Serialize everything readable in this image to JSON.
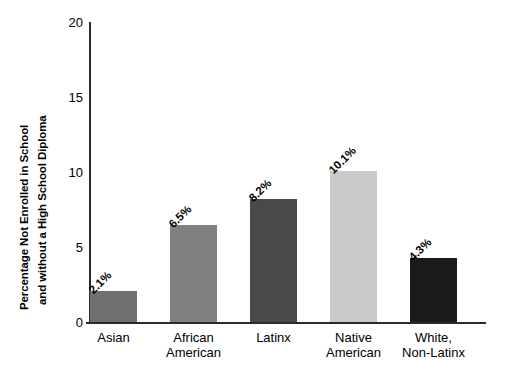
{
  "chart_data": {
    "type": "bar",
    "title": "",
    "xlabel": "",
    "ylabel_line1": "Percentage Not Enrolled in School",
    "ylabel_line2": "and without a High School Diploma",
    "categories": [
      "Asian",
      "African American",
      "Latinx",
      "Native American",
      "White, Non-Latinx"
    ],
    "category_lines": [
      [
        "Asian"
      ],
      [
        "African",
        "American"
      ],
      [
        "Latinx"
      ],
      [
        "Native",
        "American"
      ],
      [
        "White,",
        "Non-Latinx"
      ]
    ],
    "values": [
      2.1,
      6.5,
      8.2,
      10.1,
      4.3
    ],
    "data_labels": [
      "2.1%",
      "6.5%",
      "8.2%",
      "10.1%",
      "4.3%"
    ],
    "bar_colors": [
      "#707070",
      "#808080",
      "#494949",
      "#c9c9c9",
      "#1a1a1a"
    ],
    "ylim": [
      0,
      20
    ],
    "yticks": [
      0,
      5,
      10,
      15,
      20
    ],
    "ytick_labels": [
      "0",
      "5",
      "10",
      "15",
      "20"
    ],
    "grid": false,
    "legend": "none"
  }
}
